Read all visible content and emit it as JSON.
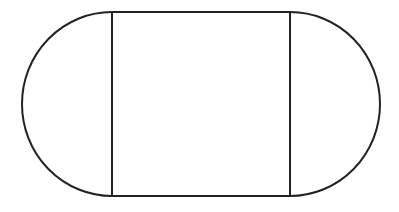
{
  "diagram": {
    "parts": [
      "left-semicircle",
      "center-rectangle",
      "right-semicircle"
    ],
    "stroke_color": "#222222",
    "fill_color": "#ffffff"
  }
}
